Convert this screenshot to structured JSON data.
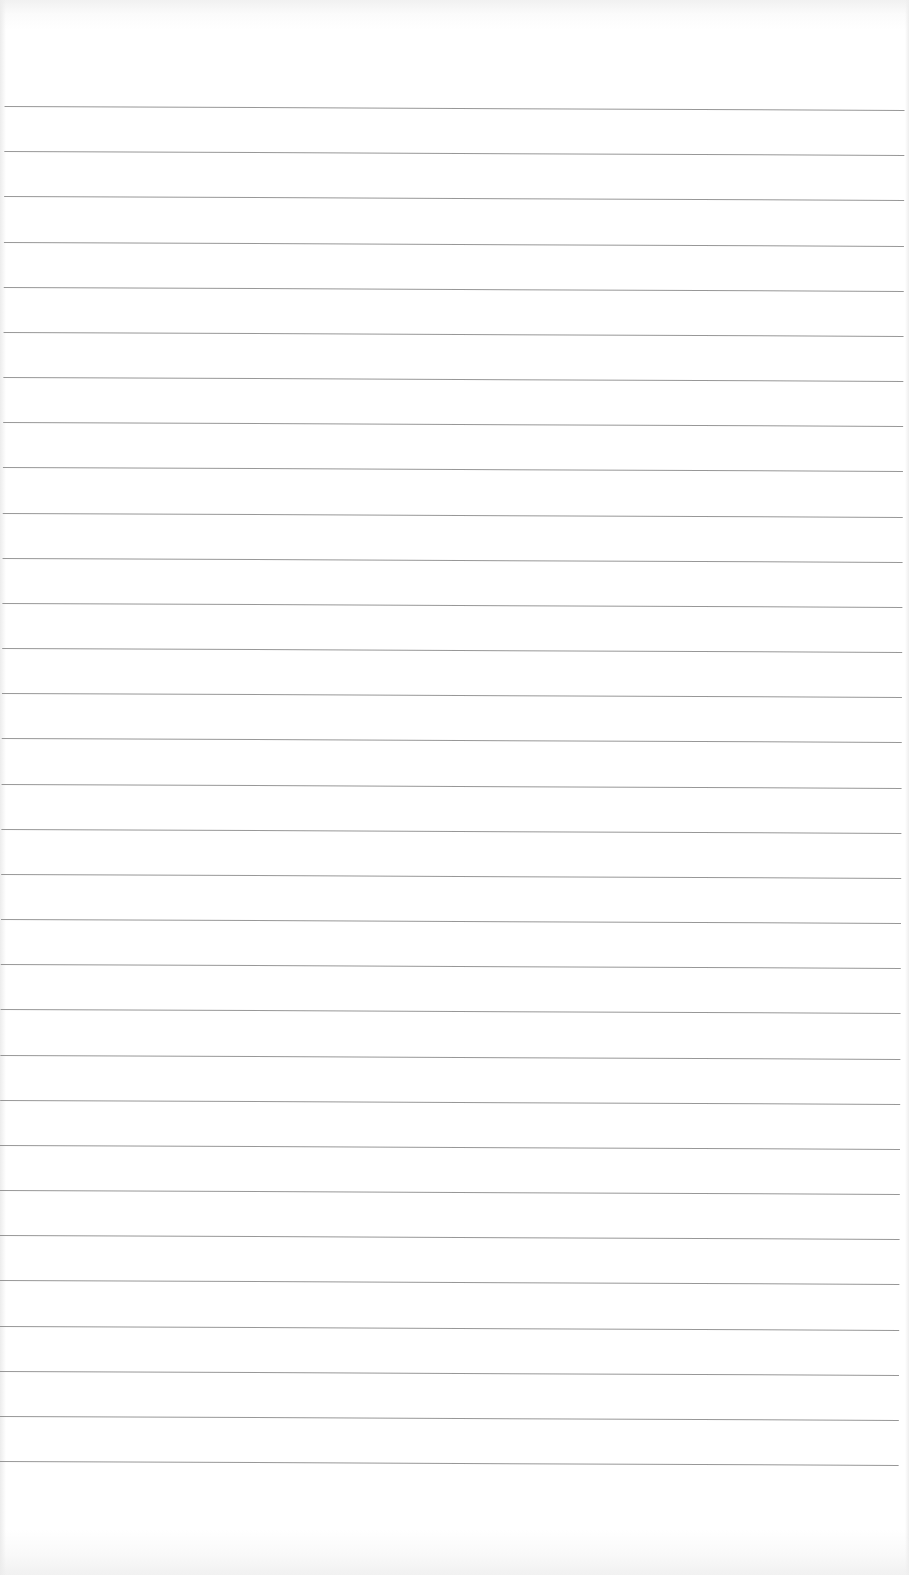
{
  "document": {
    "type": "blank ruled notebook page",
    "content_text": "",
    "ruled_lines": {
      "count": 31,
      "first_line_y": 106,
      "spacing_px": 45.17,
      "line_color": "#8c8c8c",
      "start_x": 5,
      "end_x": 905,
      "skew_deg": 0.25
    },
    "paper_color": "#ffffff"
  }
}
